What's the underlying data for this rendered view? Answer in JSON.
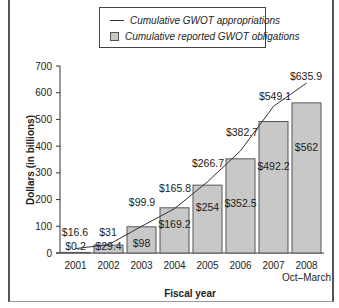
{
  "legend": {
    "line_label": "Cumulative GWOT appropriations",
    "bar_label": "Cumulative reported GWOT obligations"
  },
  "axes": {
    "ylabel": "Dollars (in billions)",
    "xlabel": "Fiscal year",
    "yticks": [
      "0",
      "100",
      "200",
      "300",
      "400",
      "500",
      "600",
      "700"
    ]
  },
  "categories": [
    "2001",
    "2002",
    "2003",
    "2004",
    "2005",
    "2006",
    "2007",
    "2008"
  ],
  "category_sublabels": [
    "",
    "",
    "",
    "",
    "",
    "",
    "",
    "Oct–March"
  ],
  "bar_labels": [
    "$0.2",
    "$29.4",
    "$98",
    "$169.2",
    "$254",
    "$352.5",
    "$492.2",
    "$562"
  ],
  "line_labels": [
    "$16.6",
    "$31",
    "$99.9",
    "$165.8",
    "$266.7",
    "$382.7",
    "$549.1",
    "$635.9"
  ],
  "colors": {
    "bar_fill": "#c8c8c8",
    "bar_stroke": "#555555",
    "line": "#333333"
  },
  "chart_data": {
    "type": "bar",
    "title": "",
    "categories": [
      "2001",
      "2002",
      "2003",
      "2004",
      "2005",
      "2006",
      "2007",
      "2008 Oct–March"
    ],
    "series": [
      {
        "name": "Cumulative reported GWOT obligations",
        "type": "bar",
        "values": [
          0.2,
          29.4,
          98,
          169.2,
          254,
          352.5,
          492.2,
          562
        ]
      },
      {
        "name": "Cumulative GWOT appropriations",
        "type": "line",
        "values": [
          16.6,
          31,
          99.9,
          165.8,
          266.7,
          382.7,
          549.1,
          635.9
        ]
      }
    ],
    "xlabel": "Fiscal year",
    "ylabel": "Dollars (in billions)",
    "ylim": [
      0,
      700
    ],
    "yticks": [
      0,
      100,
      200,
      300,
      400,
      500,
      600,
      700
    ],
    "grid": false,
    "legend_position": "top-center"
  }
}
